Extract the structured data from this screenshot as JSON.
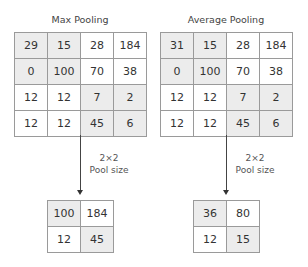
{
  "max_pooling": {
    "title": "Max Pooling",
    "input": [
      [
        "29",
        "15",
        "28",
        "184"
      ],
      [
        "0",
        "100",
        "70",
        "38"
      ],
      [
        "12",
        "12",
        "7",
        "2"
      ],
      [
        "12",
        "12",
        "45",
        "6"
      ]
    ],
    "pool_size_line1": "2×2",
    "pool_size_line2": "Pool size",
    "output": [
      [
        "100",
        "184"
      ],
      [
        "12",
        "45"
      ]
    ]
  },
  "average_pooling": {
    "title": "Average Pooling",
    "input": [
      [
        "31",
        "15",
        "28",
        "184"
      ],
      [
        "0",
        "100",
        "70",
        "38"
      ],
      [
        "12",
        "12",
        "7",
        "2"
      ],
      [
        "12",
        "12",
        "45",
        "6"
      ]
    ],
    "pool_size_line1": "2×2",
    "pool_size_line2": "Pool size",
    "output": [
      [
        "36",
        "80"
      ],
      [
        "12",
        "15"
      ]
    ]
  },
  "colors": {
    "shade": "#ececec",
    "border": "#9a9a9a",
    "arrow": "#333333"
  }
}
